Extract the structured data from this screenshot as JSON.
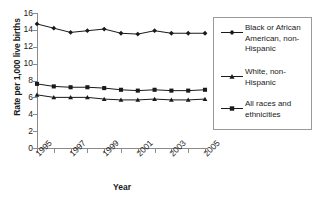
{
  "chart_data": {
    "type": "line",
    "title": "",
    "xlabel": "Year",
    "ylabel": "Rate per 1,000 live births",
    "x": [
      1995,
      1996,
      1997,
      1998,
      1999,
      2000,
      2001,
      2002,
      2003,
      2004,
      2005
    ],
    "xtick_labels": [
      "1995",
      "1997",
      "1999",
      "2001",
      "2003",
      "2005"
    ],
    "xtick_values": [
      1995,
      1997,
      1999,
      2001,
      2003,
      2005
    ],
    "ytick_labels": [
      "0",
      "2",
      "4",
      "6",
      "8",
      "10",
      "12",
      "14",
      "16"
    ],
    "ytick_values": [
      0,
      2,
      4,
      6,
      8,
      10,
      12,
      14,
      16
    ],
    "ylim": [
      0,
      16
    ],
    "xlim": [
      1995,
      2005
    ],
    "grid": false,
    "legend_position": "right",
    "series": [
      {
        "name": "Black or African American, non-Hispanic",
        "marker": "diamond",
        "color": "#1a1a1a",
        "values": [
          14.7,
          14.2,
          13.7,
          13.9,
          14.1,
          13.6,
          13.5,
          13.9,
          13.6,
          13.6,
          13.6
        ]
      },
      {
        "name": "White, non-Hispanic",
        "marker": "triangle",
        "color": "#1a1a1a",
        "values": [
          6.3,
          6.0,
          6.0,
          6.0,
          5.8,
          5.7,
          5.7,
          5.8,
          5.7,
          5.7,
          5.8
        ]
      },
      {
        "name": "All races and ethnicities",
        "marker": "square",
        "color": "#1a1a1a",
        "values": [
          7.6,
          7.3,
          7.2,
          7.2,
          7.1,
          6.9,
          6.8,
          6.9,
          6.8,
          6.8,
          6.9
        ]
      }
    ]
  },
  "axes": {
    "y_title": "Rate per 1,000 live births",
    "x_title": "Year"
  },
  "legend": {
    "entries": [
      {
        "label": "Black or African American, non-Hispanic",
        "marker": "diamond"
      },
      {
        "label": "White, non-Hispanic",
        "marker": "triangle"
      },
      {
        "label": "All races and ethnicities",
        "marker": "square"
      }
    ]
  }
}
